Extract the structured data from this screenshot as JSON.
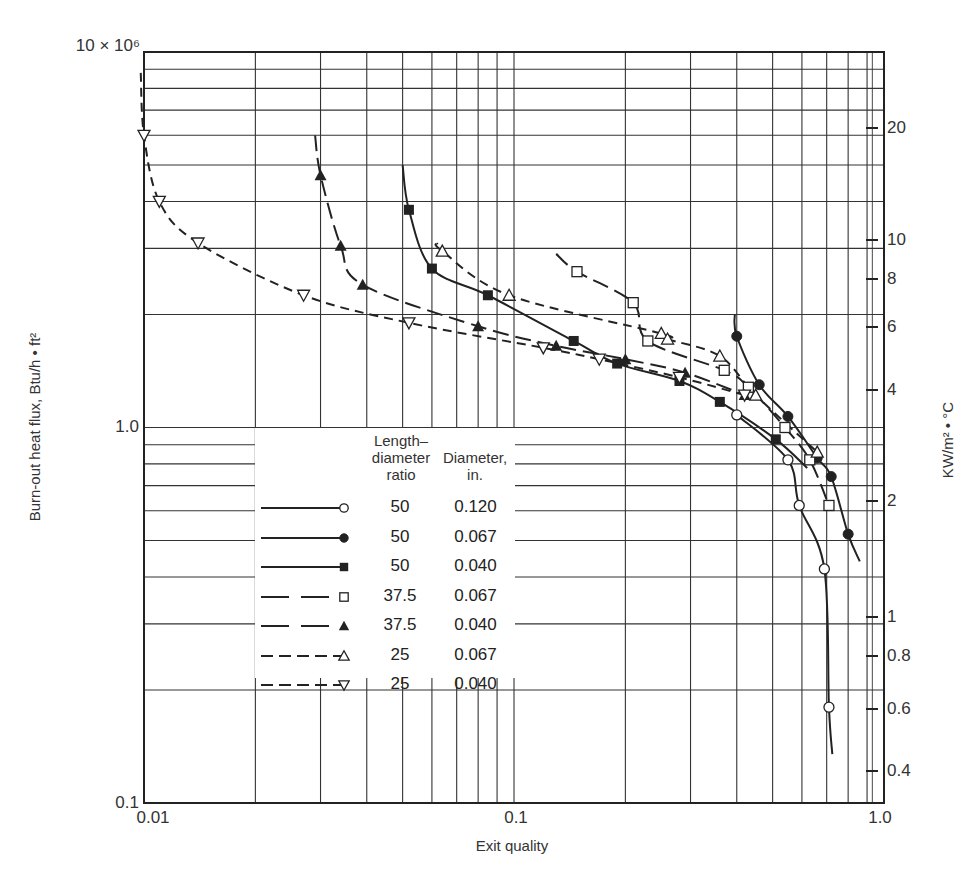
{
  "chart_data": {
    "type": "scatter",
    "title": "",
    "xlabel": "Exit quality",
    "ylabel": "Burn-out heat flux, Btu/h • ft²",
    "ylabel_right": "KW/m² • °C",
    "xscale": "log",
    "yscale": "log",
    "xlim": [
      0.01,
      1.0
    ],
    "ylim": [
      100000.0,
      10000000.0
    ],
    "grid": true,
    "legend_position": "lower-left-center",
    "x_ticks": [
      "0.01",
      "0.1",
      "1.0"
    ],
    "y_ticks_left": [
      "0.1",
      "1.0",
      "10 × 10⁶"
    ],
    "y_ticks_right": [
      "20",
      "10",
      "8",
      "6",
      "4",
      "2",
      "1",
      "0.8",
      "0.6",
      "0.4"
    ],
    "legend_header": {
      "ratio": "Length– diameter ratio",
      "diameter": "Diameter, in."
    },
    "series": [
      {
        "name": "L/D 50, D 0.120 in.",
        "ratio": "50",
        "diameter": "0.120",
        "marker": "open-circle",
        "line": "solid",
        "points": [
          [
            0.4,
            1080000.0
          ],
          [
            0.55,
            820000.0
          ],
          [
            0.59,
            620000.0
          ],
          [
            0.69,
            420000.0
          ],
          [
            0.71,
            180000.0
          ]
        ]
      },
      {
        "name": "L/D 50, D 0.067 in.",
        "ratio": "50",
        "diameter": "0.067",
        "marker": "filled-circle",
        "line": "solid",
        "points": [
          [
            0.4,
            1750000.0
          ],
          [
            0.46,
            1300000.0
          ],
          [
            0.55,
            1070000.0
          ],
          [
            0.66,
            830000.0
          ],
          [
            0.72,
            740000.0
          ],
          [
            0.8,
            520000.0
          ]
        ]
      },
      {
        "name": "L/D 50, D 0.040 in.",
        "ratio": "50",
        "diameter": "0.040",
        "marker": "filled-square",
        "line": "solid",
        "points": [
          [
            0.052,
            3800000.0
          ],
          [
            0.06,
            2650000.0
          ],
          [
            0.085,
            2250000.0
          ],
          [
            0.145,
            1700000.0
          ],
          [
            0.19,
            1480000.0
          ],
          [
            0.28,
            1330000.0
          ],
          [
            0.36,
            1170000.0
          ],
          [
            0.51,
            930000.0
          ]
        ]
      },
      {
        "name": "L/D 37.5, D 0.067 in.",
        "ratio": "37.5",
        "diameter": "0.067",
        "marker": "open-square",
        "line": "long-dash",
        "points": [
          [
            0.148,
            2600000.0
          ],
          [
            0.21,
            2150000.0
          ],
          [
            0.23,
            1700000.0
          ],
          [
            0.37,
            1420000.0
          ],
          [
            0.43,
            1280000.0
          ],
          [
            0.54,
            1000000.0
          ],
          [
            0.63,
            820000.0
          ],
          [
            0.71,
            620000.0
          ]
        ]
      },
      {
        "name": "L/D 37.5, D 0.040 in.",
        "ratio": "37.5",
        "diameter": "0.040",
        "marker": "filled-triangle",
        "line": "long-dash",
        "points": [
          [
            0.03,
            4700000.0
          ],
          [
            0.034,
            3050000.0
          ],
          [
            0.039,
            2400000.0
          ],
          [
            0.08,
            1860000.0
          ],
          [
            0.13,
            1650000.0
          ],
          [
            0.2,
            1520000.0
          ],
          [
            0.29,
            1400000.0
          ],
          [
            0.42,
            1220000.0
          ]
        ]
      },
      {
        "name": "L/D 25, D 0.067 in.",
        "ratio": "25",
        "diameter": "0.067",
        "marker": "open-triangle",
        "line": "short-dash",
        "points": [
          [
            0.064,
            2950000.0
          ],
          [
            0.097,
            2250000.0
          ],
          [
            0.25,
            1780000.0
          ],
          [
            0.26,
            1720000.0
          ],
          [
            0.36,
            1550000.0
          ],
          [
            0.45,
            1220000.0
          ],
          [
            0.66,
            860000.0
          ]
        ]
      },
      {
        "name": "L/D 25, D 0.040 in.",
        "ratio": "25",
        "diameter": "0.040",
        "marker": "open-inverted-triangle",
        "line": "short-dash",
        "points": [
          [
            0.01,
            6000000.0
          ],
          [
            0.011,
            4000000.0
          ],
          [
            0.014,
            3100000.0
          ],
          [
            0.027,
            2250000.0
          ],
          [
            0.052,
            1900000.0
          ],
          [
            0.12,
            1630000.0
          ],
          [
            0.17,
            1520000.0
          ],
          [
            0.28,
            1360000.0
          ],
          [
            0.42,
            1220000.0
          ]
        ]
      }
    ]
  },
  "axes": {
    "x_label": "Exit quality",
    "y_label_left": "Burn-out heat flux, Btu/h • ft²",
    "y_label_right": "KW/m² • °C",
    "x_ticks": [
      {
        "label": "0.01",
        "x": 153
      },
      {
        "label": "0.1",
        "x": 516
      },
      {
        "label": "1.0",
        "x": 880
      }
    ],
    "y_ticks_left": [
      {
        "label": "10 × 10⁶",
        "y": 52
      },
      {
        "label": "1.0",
        "y": 427
      },
      {
        "label": "0.1",
        "y": 803
      }
    ],
    "y_ticks_right": [
      {
        "label": "20",
        "y": 128
      },
      {
        "label": "10",
        "y": 240
      },
      {
        "label": "8",
        "y": 279
      },
      {
        "label": "6",
        "y": 327
      },
      {
        "label": "4",
        "y": 390
      },
      {
        "label": "2",
        "y": 501
      },
      {
        "label": "1",
        "y": 617
      },
      {
        "label": "0.8",
        "y": 656
      },
      {
        "label": "0.6",
        "y": 709
      },
      {
        "label": "0.4",
        "y": 771
      }
    ]
  },
  "legend": {
    "header_ratio_line1": "Length–",
    "header_ratio_line2": "diameter",
    "header_ratio_line3": "ratio",
    "header_dia_line1": "Diameter,",
    "header_dia_line2": "in.",
    "rows": [
      {
        "ratio": "50",
        "diameter": "0.120",
        "marker": "open-circle",
        "line": "solid"
      },
      {
        "ratio": "50",
        "diameter": "0.067",
        "marker": "filled-circle",
        "line": "solid"
      },
      {
        "ratio": "50",
        "diameter": "0.040",
        "marker": "filled-square",
        "line": "solid"
      },
      {
        "ratio": "37.5",
        "diameter": "0.067",
        "marker": "open-square",
        "line": "long-dash"
      },
      {
        "ratio": "37.5",
        "diameter": "0.040",
        "marker": "filled-triangle",
        "line": "long-dash"
      },
      {
        "ratio": "25",
        "diameter": "0.067",
        "marker": "open-triangle",
        "line": "short-dash"
      },
      {
        "ratio": "25",
        "diameter": "0.040",
        "marker": "open-inverted-triangle",
        "line": "short-dash"
      }
    ]
  }
}
